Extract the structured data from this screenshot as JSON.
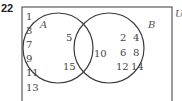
{
  "question_number": "22",
  "universal_label": "U",
  "set_a": {
    "label": "A",
    "only": [
      "5",
      "15"
    ]
  },
  "set_b": {
    "label": "B",
    "only": [
      "2",
      "4",
      "6",
      "8",
      "12",
      "14"
    ]
  },
  "intersection": [
    "10"
  ],
  "outside": [
    "1",
    "3",
    "7",
    "9",
    "11",
    "13"
  ],
  "colors": {
    "stroke": "#3a3a3a",
    "text": "#444444"
  }
}
